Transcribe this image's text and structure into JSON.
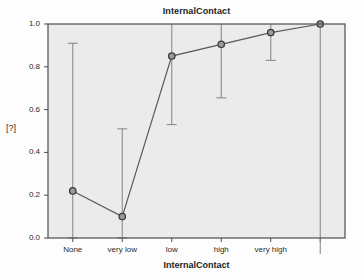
{
  "chart_data": {
    "type": "line",
    "title": "InternalContact",
    "xlabel": "InternalContact",
    "ylabel": "[?]",
    "categories": [
      "None",
      "very low",
      "low",
      "high",
      "very high",
      ""
    ],
    "values": [
      0.22,
      0.1,
      0.85,
      0.905,
      0.96,
      1.0
    ],
    "error_low": [
      0.0,
      0.0,
      0.53,
      0.655,
      0.83,
      0.0
    ],
    "error_high": [
      0.91,
      0.51,
      1.0,
      1.0,
      1.0,
      1.0
    ],
    "ylim": [
      0.0,
      1.0
    ],
    "ytick_labels": [
      "0.0",
      "0.2",
      "0.4",
      "0.6",
      "0.8",
      "1.0"
    ],
    "ytick_values": [
      0.0,
      0.2,
      0.4,
      0.6,
      0.8,
      1.0
    ],
    "grid": false,
    "legend": null,
    "series": [
      {
        "name": "InternalContact",
        "values": [
          0.22,
          0.1,
          0.85,
          0.905,
          0.96,
          1.0
        ]
      }
    ],
    "colors": {
      "plot_background": "#ebebeb",
      "plot_border": "#4d4d4d",
      "line": "#5a5a5a",
      "marker_fill": "#9a9a9a",
      "marker_stroke": "#3a3a3a",
      "errorbar": "#8c8c8c",
      "text": "#2b2b2b"
    }
  }
}
